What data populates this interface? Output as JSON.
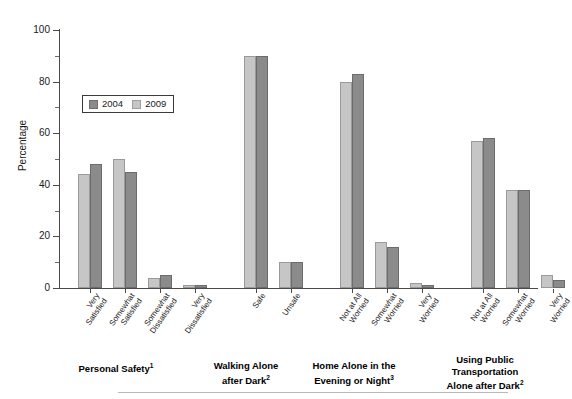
{
  "chart_data": {
    "type": "bar",
    "title": "",
    "xlabel": "",
    "ylabel": "Percentage",
    "ylim": [
      0,
      100
    ],
    "yticks": [
      0,
      20,
      40,
      60,
      80,
      100
    ],
    "ytick_labels": [
      "0",
      "20",
      "40",
      "60",
      "80",
      "100"
    ],
    "minor_yticks": [
      10,
      30,
      50,
      70,
      90
    ],
    "grid": false,
    "legend_position": "upper-left-inside",
    "series": [
      {
        "name": "2004",
        "color": "#8b8b8b"
      },
      {
        "name": "2009",
        "color": "#c6c6c6"
      }
    ],
    "groups": [
      {
        "caption": "Personal Safety",
        "caption_note": "1",
        "categories": [
          {
            "label_lines": [
              "Very",
              "Satisfied"
            ],
            "values": {
              "2009": 44,
              "2004": 48
            }
          },
          {
            "label_lines": [
              "Somewhat",
              "Satisfied"
            ],
            "values": {
              "2009": 50,
              "2004": 45
            }
          },
          {
            "label_lines": [
              "Somewhat",
              "Dissatisfied"
            ],
            "values": {
              "2009": 4,
              "2004": 5
            }
          },
          {
            "label_lines": [
              "Very",
              "Dissatisfied"
            ],
            "values": {
              "2009": 1,
              "2004": 1
            }
          }
        ]
      },
      {
        "caption_lines": [
          "Walking Alone",
          "after Dark"
        ],
        "caption_note": "2",
        "categories": [
          {
            "label_lines": [
              "Safe"
            ],
            "values": {
              "2009": 90,
              "2004": 90
            }
          },
          {
            "label_lines": [
              "Unsafe"
            ],
            "values": {
              "2009": 10,
              "2004": 10
            }
          }
        ]
      },
      {
        "caption_lines": [
          "Home Alone in the",
          "Evening or Night"
        ],
        "caption_note": "3",
        "categories": [
          {
            "label_lines": [
              "Not at All",
              "Worried"
            ],
            "values": {
              "2009": 80,
              "2004": 83
            }
          },
          {
            "label_lines": [
              "Somewhat",
              "Worried"
            ],
            "values": {
              "2009": 18,
              "2004": 16
            }
          },
          {
            "label_lines": [
              "Very",
              "Worried"
            ],
            "values": {
              "2009": 2,
              "2004": 1
            }
          }
        ]
      },
      {
        "caption_lines": [
          "Using Public",
          "Transportation",
          "Alone after Dark"
        ],
        "caption_note": "2",
        "categories": [
          {
            "label_lines": [
              "Not at All",
              "Worried"
            ],
            "values": {
              "2009": 57,
              "2004": 58
            }
          },
          {
            "label_lines": [
              "Somewhat",
              "Worried"
            ],
            "values": {
              "2009": 38,
              "2004": 38
            }
          },
          {
            "label_lines": [
              "Very",
              "Worried"
            ],
            "values": {
              "2009": 5,
              "2004": 3
            }
          }
        ]
      }
    ]
  },
  "legend": {
    "items": [
      {
        "label": "2004",
        "series": "2004"
      },
      {
        "label": "2009",
        "series": "2009"
      }
    ]
  },
  "axis": {
    "y_title": "Percentage"
  },
  "captions": {
    "g1": "Personal Safety",
    "g1_note": "1",
    "g2_l1": "Walking Alone",
    "g2_l2": "after Dark",
    "g2_note": "2",
    "g3_l1": "Home Alone in the",
    "g3_l2": "Evening or Night",
    "g3_note": "3",
    "g4_l1": "Using Public",
    "g4_l2": "Transportation",
    "g4_l3": "Alone after Dark",
    "g4_note": "2"
  }
}
